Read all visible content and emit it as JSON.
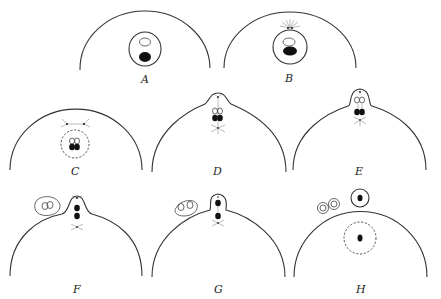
{
  "figure": {
    "panels": [
      {
        "id": "A",
        "label": "A"
      },
      {
        "id": "B",
        "label": "B"
      },
      {
        "id": "C",
        "label": "C"
      },
      {
        "id": "D",
        "label": "D"
      },
      {
        "id": "E",
        "label": "E"
      },
      {
        "id": "F",
        "label": "F"
      },
      {
        "id": "G",
        "label": "G"
      },
      {
        "id": "H",
        "label": "H"
      }
    ]
  }
}
